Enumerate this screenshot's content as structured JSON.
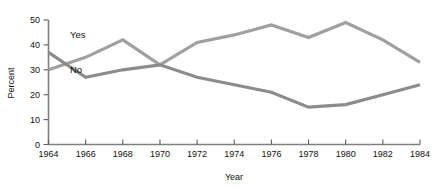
{
  "chart_data": {
    "type": "line",
    "title": "",
    "xlabel": "Year",
    "ylabel": "Percent",
    "x": [
      1964,
      1966,
      1968,
      1970,
      1972,
      1974,
      1976,
      1978,
      1980,
      1982,
      1984
    ],
    "xlim": [
      1964,
      1984
    ],
    "ylim": [
      0,
      50
    ],
    "xticks": [
      1964,
      1966,
      1968,
      1970,
      1972,
      1974,
      1976,
      1978,
      1980,
      1982,
      1984
    ],
    "xtick_labels": [
      "1964",
      "1966",
      "1968",
      "1970",
      "1972",
      "1974",
      "1976",
      "1978",
      "1980",
      "1982",
      "1984"
    ],
    "yticks": [
      0,
      10,
      20,
      30,
      40,
      50
    ],
    "ytick_labels": [
      "0",
      "10",
      "20",
      "30",
      "40",
      "50"
    ],
    "grid": false,
    "legend": "inline-annotations",
    "series": [
      {
        "name": "Yes",
        "color": "#a0a0a0",
        "label_text": "Yes",
        "values": [
          30,
          35,
          42,
          32,
          41,
          44,
          48,
          43,
          49,
          42,
          33
        ]
      },
      {
        "name": "No",
        "color": "#8c8c8c",
        "label_text": "No",
        "values": [
          37,
          27,
          30,
          32,
          27,
          24,
          21,
          15,
          16,
          20,
          24
        ]
      }
    ]
  },
  "annotations": {
    "yes_label": "Yes",
    "no_label": "No"
  },
  "colors": {
    "series_yes": "#a8a8a8",
    "series_no": "#8f8f8f",
    "axis": "#7d7d7d",
    "text": "#111111",
    "background": "#ffffff"
  }
}
